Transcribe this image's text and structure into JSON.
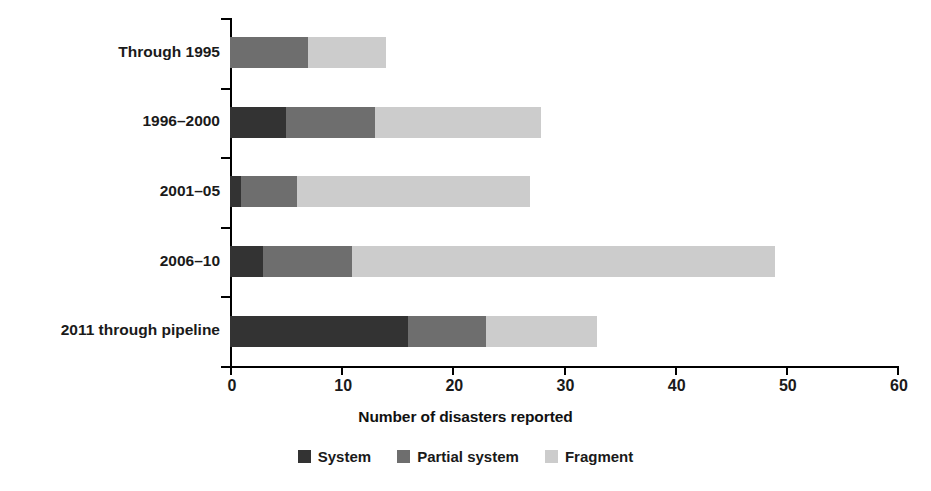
{
  "chart_data": {
    "type": "bar",
    "orientation": "horizontal",
    "stacked": true,
    "title": "",
    "xlabel": "Number of disasters reported",
    "ylabel": "",
    "xlim": [
      0,
      60
    ],
    "xticks": [
      0,
      10,
      20,
      30,
      40,
      50,
      60
    ],
    "xtick_labels": [
      "0",
      "10",
      "20",
      "30",
      "40",
      "50",
      "60"
    ],
    "grid": false,
    "legend_position": "bottom-center",
    "categories": [
      "Through 1995",
      "1996–2000",
      "2001–05",
      "2006–10",
      "2011 through pipeline"
    ],
    "series": [
      {
        "name": "System",
        "color": "#333333",
        "values": [
          0,
          5,
          1,
          3,
          16
        ]
      },
      {
        "name": "Partial system",
        "color": "#6e6e6e",
        "values": [
          7,
          8,
          5,
          8,
          7
        ]
      },
      {
        "name": "Fragment",
        "color": "#cccccc",
        "values": [
          7,
          15,
          21,
          38,
          10
        ]
      }
    ],
    "totals": [
      14,
      28,
      27,
      49,
      33
    ]
  },
  "axis": {
    "x_title": "Number of disasters reported",
    "tick_labels": [
      "0",
      "10",
      "20",
      "30",
      "40",
      "50",
      "60"
    ]
  },
  "categories": [
    {
      "label": "Through 1995"
    },
    {
      "label": "1996–2000"
    },
    {
      "label": "2001–05"
    },
    {
      "label": "2006–10"
    },
    {
      "label": "2011 through pipeline"
    }
  ],
  "legend": {
    "items": [
      {
        "label": "System",
        "color": "#333333"
      },
      {
        "label": "Partial system",
        "color": "#6e6e6e"
      },
      {
        "label": "Fragment",
        "color": "#cccccc"
      }
    ]
  }
}
